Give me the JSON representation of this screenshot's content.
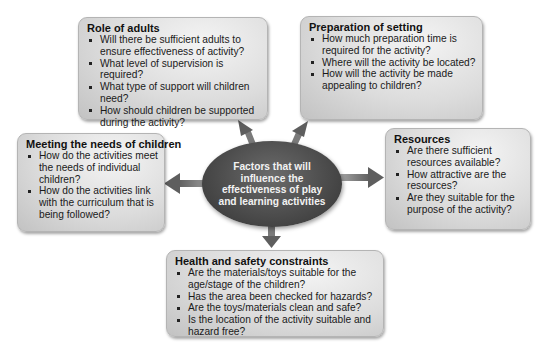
{
  "center": {
    "label": "Factors that will influence the effectiveness of play and learning activities",
    "fill_color": "#4c4c4c",
    "text_color": "#f2f2f2"
  },
  "boxes": {
    "role_of_adults": {
      "title": "Role of adults",
      "items": [
        "Will there be sufficient adults to ensure effectiveness of activity?",
        "What level of supervision is required?",
        "What type of support will children need?",
        "How should children be supported during the activity?"
      ]
    },
    "preparation_of_setting": {
      "title": "Preparation of setting",
      "items": [
        "How much preparation time is required for the activity?",
        "Where will the activity be located?",
        "How will the activity be made appealing to children?"
      ]
    },
    "meeting_needs": {
      "title": "Meeting the needs of children",
      "items": [
        "How do the activities meet the needs of individual children?",
        "How do the activities link with the curriculum that is being followed?"
      ]
    },
    "resources": {
      "title": "Resources",
      "items": [
        "Are there sufficient resources available?",
        "How attractive are the resources?",
        "Are they suitable for the purpose of the activity?"
      ]
    },
    "health_safety": {
      "title": "Health and safety constraints",
      "items": [
        "Are the materials/toys suitable for the age/stage of the children?",
        "Has the area been checked for hazards?",
        "Are the toys/materials clean and safe?",
        "Is the location of the activity suitable and hazard free?"
      ]
    }
  },
  "colors": {
    "box_fill": "#dcdcdc",
    "arrow": "#6e6e6e",
    "background": "#ffffff"
  }
}
